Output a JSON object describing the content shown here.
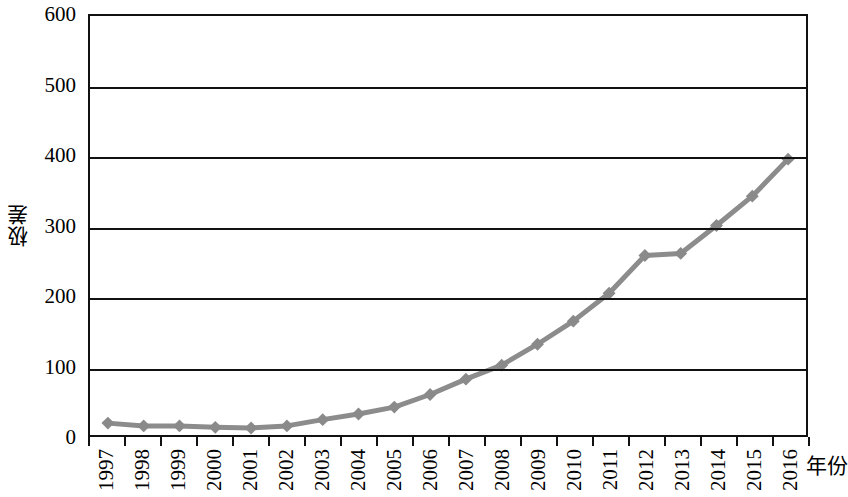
{
  "chart_data": {
    "type": "line",
    "title": "",
    "subtitle": "",
    "xlabel": "年份",
    "ylabel": "极差",
    "categories": [
      "1997",
      "1998",
      "1999",
      "2000",
      "2001",
      "2002",
      "2003",
      "2004",
      "2005",
      "2006",
      "2007",
      "2008",
      "2009",
      "2010",
      "2011",
      "2012",
      "2013",
      "2014",
      "2015",
      "2016"
    ],
    "values": [
      17,
      13,
      13,
      11,
      10,
      13,
      22,
      30,
      40,
      58,
      80,
      100,
      130,
      163,
      203,
      257,
      260,
      300,
      342,
      395
    ],
    "series": [
      {
        "name": "极差",
        "values": [
          17,
          13,
          13,
          11,
          10,
          13,
          22,
          30,
          40,
          58,
          80,
          100,
          130,
          163,
          203,
          257,
          260,
          300,
          342,
          395
        ]
      }
    ],
    "ylim": [
      0,
      600
    ],
    "y_ticks": [
      0,
      100,
      200,
      300,
      400,
      500,
      600
    ],
    "y_tick_labels": [
      "0",
      "100",
      "200",
      "300",
      "400",
      "500",
      "600"
    ],
    "grid": "horizontal",
    "legend": "none",
    "marker": "diamond",
    "line_color": "#8c8c8c",
    "marker_color": "#8a8a8a",
    "axis_color": "#111111",
    "background_color": "#ffffff"
  },
  "axes": {
    "y_title": "极差",
    "x_title": "年份"
  }
}
